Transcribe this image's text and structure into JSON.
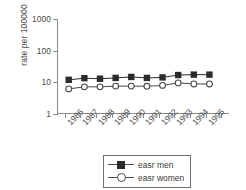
{
  "chart_data": {
    "type": "line",
    "title": "",
    "subtitle": "",
    "xlabel": "",
    "ylabel": "rate per 100000",
    "categories": [
      "1986",
      "1987",
      "1988",
      "1989",
      "1990",
      "1991",
      "1992",
      "1993",
      "1994",
      "1995"
    ],
    "yscale": "log",
    "ylim": [
      1,
      1000
    ],
    "ytick_labels": [
      "1000",
      "100",
      "10",
      "1"
    ],
    "ytick_values": [
      1000,
      100,
      10,
      1
    ],
    "grid": false,
    "legend_position": "bottom-center",
    "series": [
      {
        "name": "easr men",
        "marker": "filled-square",
        "color": "#2b2b2b",
        "values": [
          12,
          13.5,
          13,
          13.8,
          14.8,
          13.8,
          14.3,
          17,
          17.5,
          17.5
        ]
      },
      {
        "name": "easr women",
        "marker": "open-circle",
        "color": "#4a4a4a",
        "values": [
          6.2,
          7.2,
          7.2,
          7.6,
          7.6,
          7.5,
          8,
          9.6,
          8.9,
          8.9
        ]
      }
    ]
  },
  "legend": {
    "items": [
      {
        "label": "easr men",
        "marker": "filled-square-icon"
      },
      {
        "label": "easr women",
        "marker": "open-circle-icon"
      }
    ]
  }
}
